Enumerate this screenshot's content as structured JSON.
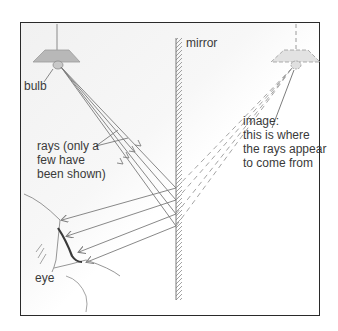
{
  "figure": {
    "labels": {
      "bulb": "bulb",
      "mirror": "mirror",
      "rays": "rays (only a\nfew have\nbeen shown)",
      "image": "image:\nthis is where\nthe rays appear\nto come from",
      "eye": "eye"
    },
    "colors": {
      "frame": "#2a2a2a",
      "lamp_shade": "#b8b8b8",
      "ray": "#7a7a7a",
      "virtual_ray": "#9a9a9a",
      "text": "#3a3a3a",
      "background_shading": "#efefef"
    },
    "elements": {
      "real_lamp": {
        "x": 57,
        "y": 55
      },
      "virtual_lamp": {
        "x": 296,
        "y": 55
      },
      "mirror_x": 176,
      "ray_count": 4
    }
  }
}
